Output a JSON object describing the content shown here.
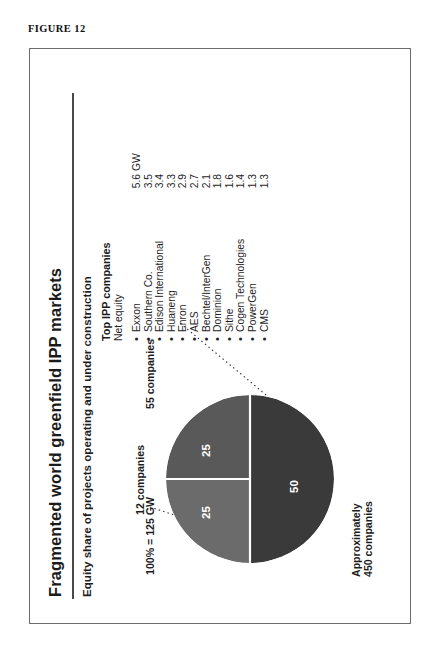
{
  "figure": {
    "caption": "FIGURE 12"
  },
  "chart_header": {
    "title": "Fragmented world greenfield IPP markets",
    "subtitle": "Equity share of projects operating and under construction"
  },
  "pie_labels": {
    "total": "100% = 125 GW",
    "segment_top_left": "12 companies",
    "segment_top_right": "55 companies",
    "segment_bottom_line1": "Approximately",
    "segment_bottom_line2": "450 companies"
  },
  "company_list": {
    "heading": "Top IPP companies",
    "subheading": "Net equity",
    "bullet": "•",
    "items": [
      {
        "name": "Exxon",
        "value": "5.6",
        "unit": "GW"
      },
      {
        "name": "Southern Co.",
        "value": "3.5",
        "unit": ""
      },
      {
        "name": "Edison International",
        "value": "3.4",
        "unit": ""
      },
      {
        "name": "Huaneng",
        "value": "3.3",
        "unit": ""
      },
      {
        "name": "Enron",
        "value": "2.9",
        "unit": ""
      },
      {
        "name": "AES",
        "value": "2.7",
        "unit": ""
      },
      {
        "name": "Bechtel/InterGen",
        "value": "2.1",
        "unit": ""
      },
      {
        "name": "Dominion",
        "value": "1.8",
        "unit": ""
      },
      {
        "name": "Sithe",
        "value": "1.6",
        "unit": ""
      },
      {
        "name": "Cogen Technologies",
        "value": "1.4",
        "unit": ""
      },
      {
        "name": "PowerGen",
        "value": "1.3",
        "unit": ""
      },
      {
        "name": "CMS",
        "value": "1.3",
        "unit": ""
      }
    ]
  },
  "chart_data": {
    "type": "pie",
    "title": "Fragmented world greenfield IPP markets",
    "subtitle": "Equity share of projects operating and under construction",
    "total_label": "100% = 125 GW",
    "total_value": 125,
    "total_unit": "GW",
    "categories": [
      "12 companies",
      "55 companies",
      "Approximately 450 companies"
    ],
    "values": [
      25,
      25,
      50
    ],
    "value_labels": [
      "25",
      "25",
      "50"
    ],
    "colors": [
      "#6b6b6b",
      "#595959",
      "#3a3a3a"
    ],
    "legend": "none",
    "grid": false,
    "annotations": [
      "12 companies",
      "55 companies",
      "Approximately 450 companies"
    ]
  },
  "colors": {
    "panel_border": "#6d6d6d",
    "rule": "#4a4a4a",
    "slice_light": "#6b6b6b",
    "slice_mid": "#595959",
    "slice_dark": "#3a3a3a",
    "text": "#1a1a1a"
  }
}
